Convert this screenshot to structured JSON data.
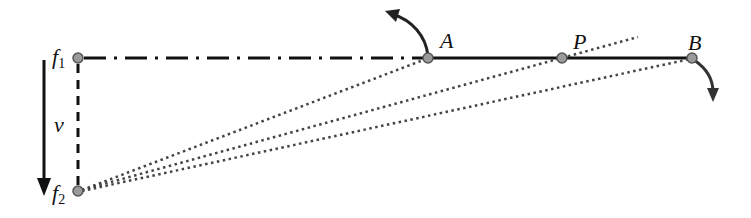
{
  "diagram": {
    "type": "geometric-kinematics-diagram",
    "colors": {
      "line": "#111111",
      "point_fill": "#9a9a9a",
      "point_stroke": "#555555",
      "dotted": "#444444",
      "background": "#ffffff"
    },
    "points": {
      "f1": {
        "label": "f",
        "sub": "1",
        "x": 78,
        "y": 58
      },
      "f2": {
        "label": "f",
        "sub": "2",
        "x": 78,
        "y": 191
      },
      "A": {
        "label": "A",
        "x": 428,
        "y": 58
      },
      "P": {
        "label": "P",
        "x": 562,
        "y": 58
      },
      "B": {
        "label": "B",
        "x": 692,
        "y": 58
      }
    },
    "velocity": {
      "label": "v",
      "from": [
        44,
        60
      ],
      "to": [
        44,
        194
      ]
    },
    "lines": [
      {
        "name": "f1-A",
        "style": "dash-dot"
      },
      {
        "name": "A-B",
        "style": "solid"
      },
      {
        "name": "f1-f2",
        "style": "dashed"
      },
      {
        "name": "f2-A",
        "style": "dotted"
      },
      {
        "name": "f2-P-extended",
        "style": "dotted",
        "end": [
          638,
          37
        ]
      },
      {
        "name": "f2-B",
        "style": "dotted"
      }
    ],
    "rotation_arrows": [
      {
        "at": "A",
        "direction": "counter-clockwise",
        "tip": [
          388,
          14
        ]
      },
      {
        "at": "B",
        "direction": "clockwise",
        "tip": [
          713,
          100
        ]
      }
    ]
  }
}
